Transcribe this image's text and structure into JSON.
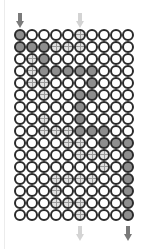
{
  "diagram": {
    "columns": 10,
    "rows": 16,
    "colors": {
      "gray": "#8e8e8e",
      "hatch": "#e2e2e2",
      "border": "#2a2a2a",
      "arrow_gray": "#7a7a7a",
      "arrow_light": "#d4d4d4"
    },
    "grid": [
      [
        "gray",
        "white",
        "white",
        "white",
        "white",
        "hatch",
        "white",
        "white",
        "white",
        "white"
      ],
      [
        "gray",
        "gray",
        "gray",
        "hatch",
        "hatch",
        "hatch",
        "white",
        "white",
        "white",
        "white"
      ],
      [
        "white",
        "hatch",
        "gray",
        "white",
        "white",
        "white",
        "white",
        "white",
        "white",
        "white"
      ],
      [
        "white",
        "hatch",
        "gray",
        "gray",
        "gray",
        "gray",
        "gray",
        "white",
        "white",
        "white"
      ],
      [
        "white",
        "hatch",
        "hatch",
        "white",
        "white",
        "white",
        "gray",
        "white",
        "white",
        "white"
      ],
      [
        "white",
        "white",
        "hatch",
        "white",
        "white",
        "gray",
        "gray",
        "white",
        "white",
        "white"
      ],
      [
        "white",
        "white",
        "white",
        "white",
        "white",
        "gray",
        "white",
        "white",
        "white",
        "white"
      ],
      [
        "white",
        "white",
        "hatch",
        "white",
        "white",
        "gray",
        "white",
        "white",
        "white",
        "white"
      ],
      [
        "white",
        "white",
        "hatch",
        "hatch",
        "hatch",
        "gray",
        "gray",
        "gray",
        "white",
        "white"
      ],
      [
        "white",
        "white",
        "white",
        "white",
        "hatch",
        "hatch",
        "white",
        "gray",
        "gray",
        "gray"
      ],
      [
        "white",
        "white",
        "white",
        "white",
        "white",
        "hatch",
        "hatch",
        "hatch",
        "white",
        "gray"
      ],
      [
        "white",
        "white",
        "white",
        "white",
        "white",
        "white",
        "white",
        "hatch",
        "white",
        "gray"
      ],
      [
        "white",
        "white",
        "white",
        "hatch",
        "hatch",
        "hatch",
        "hatch",
        "white",
        "white",
        "gray"
      ],
      [
        "white",
        "white",
        "white",
        "hatch",
        "white",
        "white",
        "white",
        "white",
        "white",
        "gray"
      ],
      [
        "white",
        "white",
        "white",
        "hatch",
        "hatch",
        "hatch",
        "white",
        "white",
        "white",
        "gray"
      ],
      [
        "white",
        "white",
        "white",
        "white",
        "white",
        "hatch",
        "white",
        "white",
        "white",
        "gray"
      ]
    ],
    "arrows": [
      {
        "position": "top",
        "column": 1,
        "style": "gray"
      },
      {
        "position": "top",
        "column": 6,
        "style": "light"
      },
      {
        "position": "bottom",
        "column": 6,
        "style": "light"
      },
      {
        "position": "bottom",
        "column": 10,
        "style": "gray"
      }
    ]
  }
}
